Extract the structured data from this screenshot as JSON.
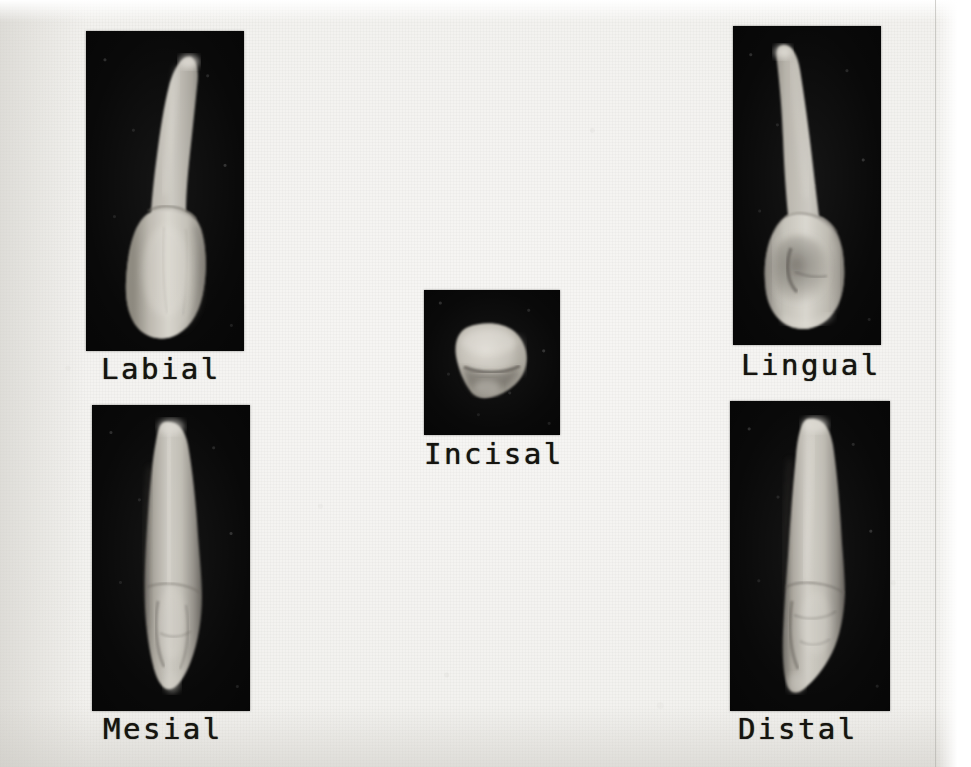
{
  "figure": {
    "background_color": "#f2f1ee",
    "panel_color": "#090909",
    "caption_color": "#15140f",
    "panels": [
      {
        "id": "labial",
        "label": "Labial",
        "view": "labial",
        "position": "top-left",
        "panel_rect": {
          "x": 86,
          "y": 31,
          "w": 158,
          "h": 320
        },
        "caption_pos": {
          "x": 101,
          "y": 352
        }
      },
      {
        "id": "lingual",
        "label": "Lingual",
        "view": "lingual",
        "position": "top-right",
        "panel_rect": {
          "x": 733,
          "y": 26,
          "w": 148,
          "h": 319
        },
        "caption_pos": {
          "x": 741,
          "y": 348
        }
      },
      {
        "id": "incisal",
        "label": "Incisal",
        "view": "incisal",
        "position": "center",
        "panel_rect": {
          "x": 424,
          "y": 290,
          "w": 136,
          "h": 145
        },
        "caption_pos": {
          "x": 424,
          "y": 437
        }
      },
      {
        "id": "mesial",
        "label": "Mesial",
        "view": "mesial",
        "position": "bottom-left",
        "panel_rect": {
          "x": 92,
          "y": 405,
          "w": 158,
          "h": 306
        },
        "caption_pos": {
          "x": 103,
          "y": 712
        }
      },
      {
        "id": "distal",
        "label": "Distal",
        "view": "distal",
        "position": "bottom-right",
        "panel_rect": {
          "x": 730,
          "y": 401,
          "w": 160,
          "h": 310
        },
        "caption_pos": {
          "x": 738,
          "y": 712
        }
      }
    ]
  }
}
